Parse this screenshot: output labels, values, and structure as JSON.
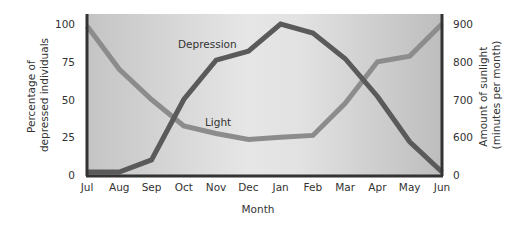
{
  "chart_data": {
    "type": "line",
    "title": "",
    "xlabel": "Month",
    "ylabel_left": "Percentage of depressed individuals",
    "ylabel_left_lines": [
      "Percentage of",
      "depressed individuals"
    ],
    "ylabel_right": "Amount of sunlight (minutes per month)",
    "ylabel_right_lines": [
      "Amount of sunlight",
      "(minutes per month)"
    ],
    "categories": [
      "Jul",
      "Aug",
      "Sep",
      "Oct",
      "Nov",
      "Dec",
      "Jan",
      "Feb",
      "Mar",
      "Apr",
      "May",
      "Jun"
    ],
    "left_ticks": [
      0,
      25,
      50,
      75,
      100
    ],
    "right_ticks": [
      0,
      600,
      700,
      800,
      900
    ],
    "right_axis_note": "broken axis: 0 then 600–900",
    "ylim_left": [
      0,
      100
    ],
    "grid": false,
    "legend": "inline labels",
    "series": [
      {
        "name": "Depression",
        "axis": "left",
        "color": "#5a5a5a",
        "values": [
          2,
          2,
          10,
          50,
          76,
          82,
          100,
          94,
          77,
          52,
          22,
          2
        ],
        "label_pos": {
          "x": 178,
          "y": 48
        }
      },
      {
        "name": "Light",
        "axis": "right",
        "color": "#8c8c8c",
        "values": [
          895,
          780,
          700,
          630,
          610,
          565,
          600,
          605,
          690,
          800,
          815,
          900
        ],
        "label_pos": {
          "x": 205,
          "y": 126
        }
      }
    ]
  }
}
